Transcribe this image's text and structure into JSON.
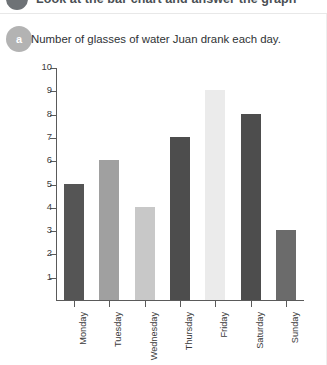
{
  "header": {
    "title": "Look at the bar chart and answer the graph",
    "circle_icon": "numbered-circle-icon"
  },
  "card": {
    "badge_label": "a",
    "question_text": "Number of glasses of water Juan drank each day."
  },
  "chart_data": {
    "type": "bar",
    "title": "Number of glasses of water Juan drank each day.",
    "xlabel": "",
    "ylabel": "",
    "categories": [
      "Monday",
      "Tuesday",
      "Wednesday",
      "Thursday",
      "Friday",
      "Saturday",
      "Sunday"
    ],
    "values": [
      5,
      6,
      4,
      7,
      9,
      8,
      3
    ],
    "bar_colors": [
      "#555555",
      "#a0a0a0",
      "#c8c8c8",
      "#4d4d4d",
      "#ebebeb",
      "#4d4d4d",
      "#6b6b6b"
    ],
    "ylim": [
      0,
      10
    ],
    "ytick_labels": [
      "1",
      "2",
      "3",
      "4",
      "5",
      "6",
      "7",
      "8",
      "9",
      "10"
    ],
    "ytick_values": [
      1,
      2,
      3,
      4,
      5,
      6,
      7,
      8,
      9,
      10
    ],
    "grid": false,
    "legend": false
  }
}
